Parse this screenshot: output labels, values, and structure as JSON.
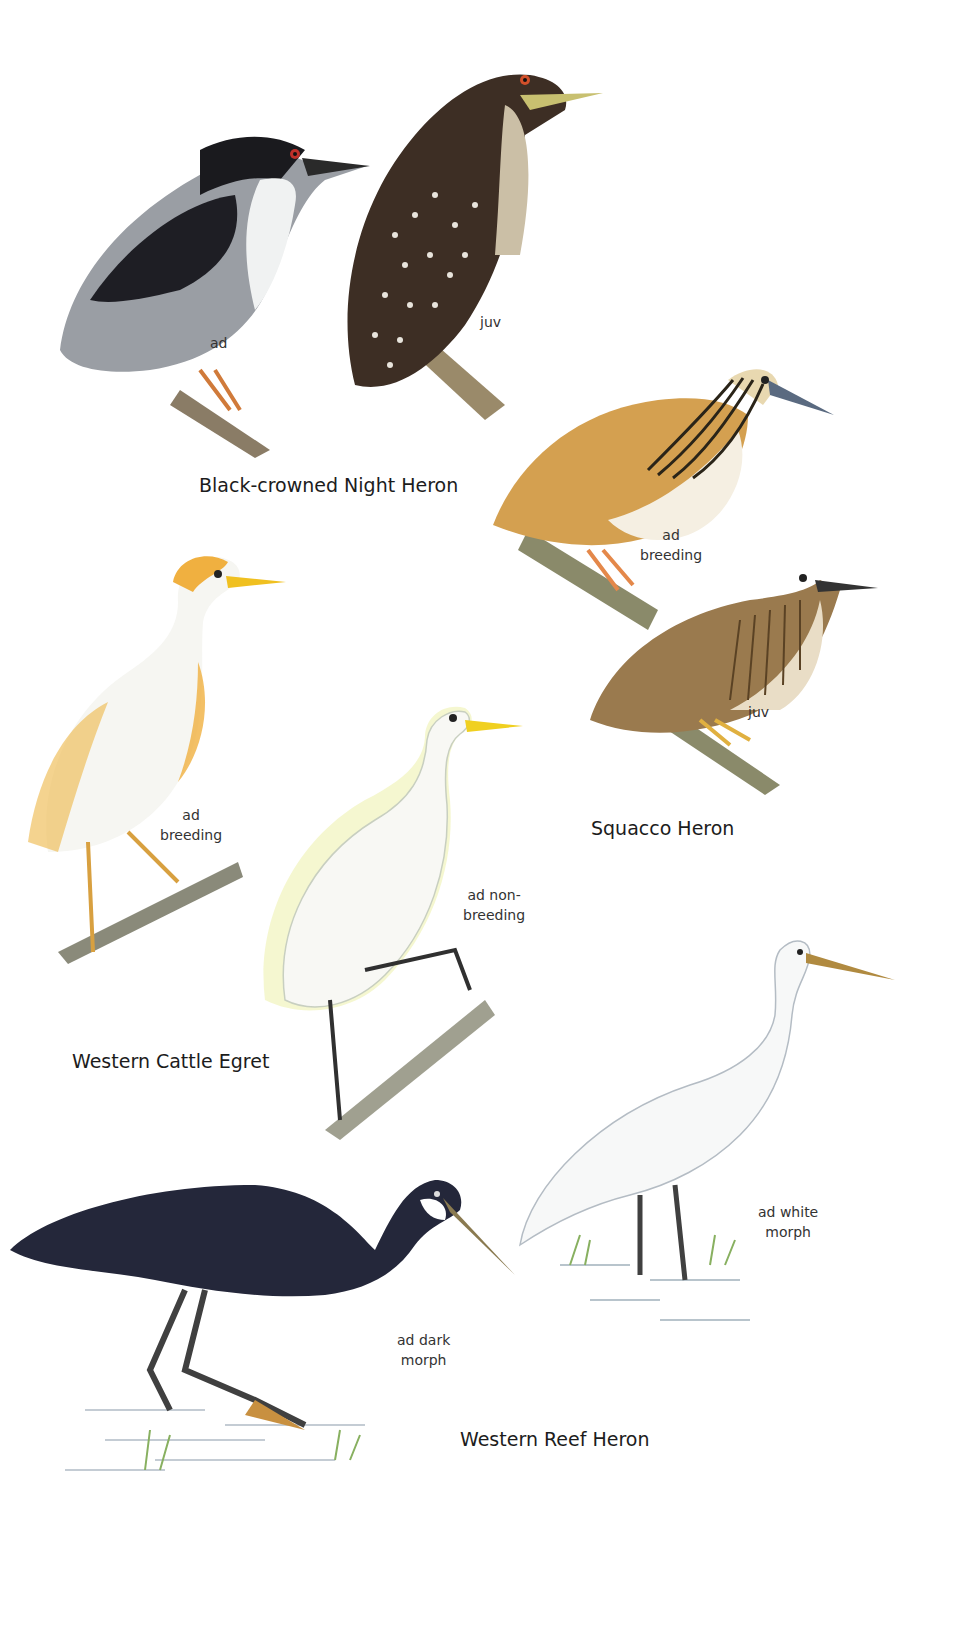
{
  "plate": {
    "background": "#ffffff",
    "species": [
      {
        "name": "Black-crowned Night Heron",
        "figures": [
          {
            "label": "ad",
            "colors": {
              "back": "#1e1e22",
              "wing": "#8c9097",
              "underparts": "#f2f3f3",
              "eye": "#c0302a",
              "legs": "#d07a3a"
            }
          },
          {
            "label": "juv",
            "colors": {
              "body": "#3d2e24",
              "spots": "#e8e4dc",
              "eye": "#d2502a",
              "bill": "#c8c070"
            }
          }
        ]
      },
      {
        "name": "Squacco Heron",
        "figures": [
          {
            "label_line1": "ad",
            "label_line2": "breeding",
            "colors": {
              "back": "#d4a050",
              "underparts": "#f5efe2",
              "crest": "#3a3020",
              "bill": "#5a6a80",
              "legs": "#e4884a"
            }
          },
          {
            "label": "juv",
            "colors": {
              "back": "#9a7a4e",
              "streaks": "#5a4224",
              "bill": "#333",
              "legs": "#e0b040"
            }
          }
        ]
      },
      {
        "name": "Western Cattle Egret",
        "figures": [
          {
            "label_line1": "ad",
            "label_line2": "breeding",
            "colors": {
              "body": "#f6f6f2",
              "plumes": "#f0b040",
              "bill": "#f0c020",
              "legs": "#d8a040"
            }
          },
          {
            "label_line1": "ad non-",
            "label_line2": "breeding",
            "colors": {
              "body": "#f8f8f4",
              "wash": "#eef2b0",
              "bill": "#f0d020",
              "legs": "#303030"
            }
          }
        ]
      },
      {
        "name": "Western Reef Heron",
        "figures": [
          {
            "label_line1": "ad dark",
            "label_line2": "morph",
            "colors": {
              "body": "#24273a",
              "throat": "#ffffff",
              "bill": "#8a7a50",
              "legs": "#404040",
              "feet": "#c89040"
            }
          },
          {
            "label_line1": "ad white",
            "label_line2": "morph",
            "colors": {
              "body": "#f7f8f8",
              "bill": "#b08a40",
              "legs": "#404040"
            }
          }
        ]
      }
    ]
  }
}
